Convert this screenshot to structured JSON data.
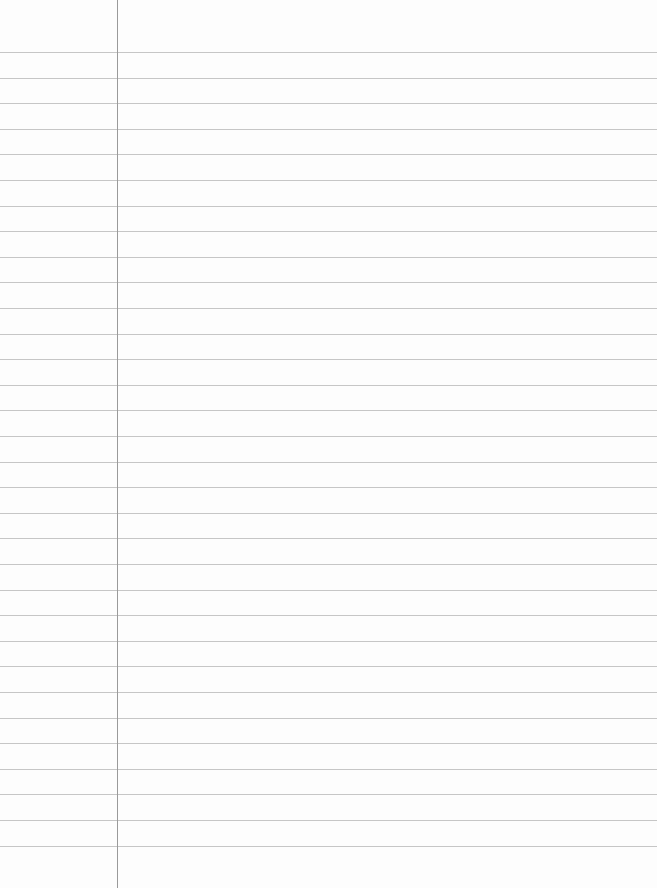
{
  "paper": {
    "type": "lined-paper",
    "background_color": "#fdfdfd",
    "rule_color": "#c6c6c6",
    "margin_color": "#9a9a9a",
    "first_rule_y": 52,
    "rule_spacing": 25.6,
    "rule_count": 32,
    "margin_x": 117
  }
}
